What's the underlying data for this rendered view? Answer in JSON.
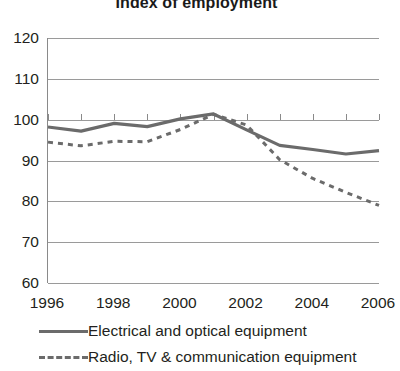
{
  "chart_data": {
    "type": "line",
    "title": "Index of employment",
    "xlabel": "",
    "ylabel": "",
    "xlim": [
      1996,
      2006
    ],
    "ylim": [
      60,
      120
    ],
    "yticks": [
      120,
      110,
      100,
      90,
      80,
      70,
      60
    ],
    "xticks": [
      1996,
      1998,
      2000,
      2002,
      2004,
      2006
    ],
    "xtick_labels": [
      "1996",
      "1998",
      "2000",
      "2002",
      "2004",
      "2006"
    ],
    "grid": true,
    "legend_position": "bottom",
    "x": [
      1996,
      1997,
      1998,
      1999,
      2000,
      2001,
      2002,
      2003,
      2004,
      2005,
      2006
    ],
    "series": [
      {
        "name": "Electrical and optical equipment",
        "style": "solid",
        "color": "#6b6b6b",
        "values": [
          98.2,
          97.2,
          99.1,
          98.3,
          100.2,
          101.4,
          97.5,
          93.7,
          92.7,
          91.6,
          92.4
        ]
      },
      {
        "name": "Radio, TV & communication equipment",
        "style": "dashed",
        "color": "#6b6b6b",
        "values": [
          94.5,
          93.6,
          94.7,
          94.6,
          97.6,
          101.3,
          98.7,
          90.2,
          85.6,
          82.2,
          79.0
        ]
      }
    ]
  },
  "legend": {
    "items": [
      {
        "label": "Electrical and optical equipment",
        "style": "solid"
      },
      {
        "label": "Radio, TV & communication equipment",
        "style": "dashed"
      }
    ]
  },
  "colors": {
    "line": "#6b6b6b",
    "grid": "#9a9a9a",
    "axis": "#8a8a8a",
    "text": "#231f20",
    "background": "#ffffff"
  }
}
